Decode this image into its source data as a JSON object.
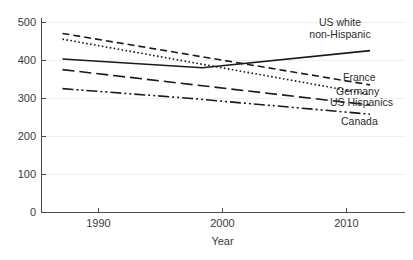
{
  "chart_data": {
    "type": "line",
    "title": "",
    "subtitle": "",
    "xlabel": "Year",
    "ylabel": "",
    "xlim": [
      1986.5,
      2012.5
    ],
    "ylim": [
      0,
      500
    ],
    "x_ticks": [
      1990,
      2000,
      2010
    ],
    "x_tick_labels": [
      "1990",
      "2000",
      "2010"
    ],
    "y_ticks": [
      0,
      100,
      200,
      300,
      400,
      500
    ],
    "y_tick_labels": [
      "0",
      "100",
      "200",
      "300",
      "400",
      "500"
    ],
    "grid": "horizontal-faint",
    "legend_position": "inline-right-end-labels",
    "series": [
      {
        "name": "US white non-Hispanic",
        "label": "US white",
        "label_line2": "non-Hispanic",
        "style": "solid",
        "dasharray": "none",
        "color": "#1a1a1a",
        "x": [
          1988,
          1998,
          2010
        ],
        "values": [
          403,
          380,
          425
        ]
      },
      {
        "name": "France",
        "label": "France",
        "style": "dashed",
        "dasharray": "7,4",
        "color": "#1a1a1a",
        "x": [
          1988,
          2010
        ],
        "values": [
          470,
          335
        ]
      },
      {
        "name": "Germany",
        "label": "Germany",
        "style": "dotted",
        "dasharray": "1.6,2.4",
        "color": "#1a1a1a",
        "x": [
          1988,
          2010
        ],
        "values": [
          455,
          310
        ]
      },
      {
        "name": "US Hispanics",
        "label": "US Hispanics",
        "style": "long-dashed",
        "dasharray": "12,5",
        "color": "#1a1a1a",
        "x": [
          1988,
          2010
        ],
        "values": [
          375,
          282
        ]
      },
      {
        "name": "Canada",
        "label": "Canada",
        "style": "dash-dot-dot",
        "dasharray": "11,3,2,3,2,3",
        "color": "#1a1a1a",
        "x": [
          1988,
          1997,
          2010
        ],
        "values": [
          325,
          300,
          258
        ]
      }
    ]
  },
  "axes": {
    "x_title": "Year",
    "y_title": ""
  },
  "colors": {
    "line": "#1a1a1a",
    "axis": "#4a4a4a",
    "grid": "#f0f0f0",
    "text": "#2b2b2b",
    "background": "#ffffff"
  }
}
